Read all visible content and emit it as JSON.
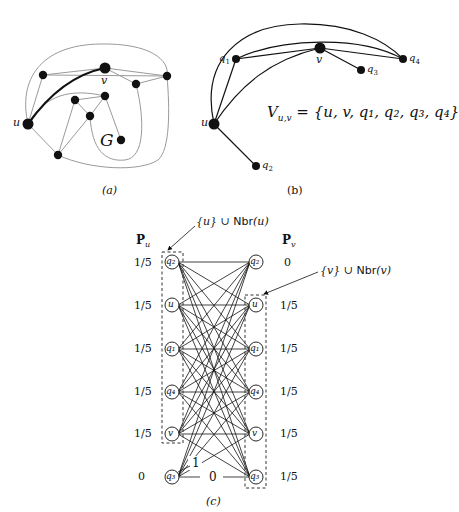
{
  "panel_a": {
    "caption": "(a)",
    "label_u": "u",
    "label_v": "v",
    "label_G": "G"
  },
  "panel_b": {
    "caption": "(b)",
    "label_u": "u",
    "label_v": "v",
    "label_q1": "q",
    "label_q1_sub": "1",
    "label_q2": "q",
    "label_q2_sub": "2",
    "label_q3": "q",
    "label_q3_sub": "3",
    "label_q4": "q",
    "label_q4_sub": "4",
    "formula_lhs": "V",
    "formula_sub": "u,v",
    "formula_rhs": " = {u, v, q₁, q₂, q₃, q₄}"
  },
  "panel_c": {
    "caption": "(c)",
    "header_left": "P",
    "header_left_sub": "u",
    "header_right": "P",
    "header_right_sub": "v",
    "annotation_left_math": "{u} ∪ ",
    "annotation_left_sf": "Nbr",
    "annotation_left_arg": "(u)",
    "annotation_right_math": "{v} ∪ ",
    "annotation_right_sf": "Nbr",
    "annotation_right_arg": "(v)",
    "nodes": [
      "q₂",
      "u",
      "q₁",
      "q₄",
      "v",
      "q₃"
    ],
    "prob_left": [
      "1/5",
      "1/5",
      "1/5",
      "1/5",
      "1/5",
      "0"
    ],
    "prob_right": [
      "0",
      "1/5",
      "1/5",
      "1/5",
      "1/5",
      "1/5"
    ],
    "edge_label_1": "1",
    "edge_label_0": "0"
  }
}
